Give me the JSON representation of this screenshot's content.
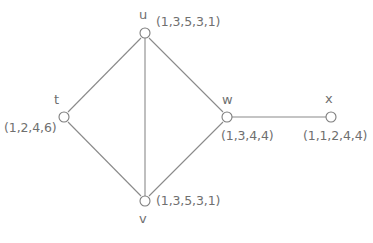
{
  "diagram": {
    "background_color": "#ffffff",
    "line_color": "#8a8a8a",
    "text_color": "#6f6f6f",
    "nodes": [
      {
        "id": "t",
        "label": "t",
        "tuple": "(1,2,4,6)",
        "cx": 64,
        "cy": 117,
        "r": 5
      },
      {
        "id": "u",
        "label": "u",
        "tuple": "(1,3,5,3,1)",
        "cx": 145,
        "cy": 33,
        "r": 5
      },
      {
        "id": "v",
        "label": "v",
        "tuple": "(1,3,5,3,1)",
        "cx": 145,
        "cy": 201,
        "r": 5
      },
      {
        "id": "w",
        "label": "w",
        "tuple": "(1,3,4,4)",
        "cx": 227,
        "cy": 117,
        "r": 5
      },
      {
        "id": "x",
        "label": "x",
        "tuple": "(1,1,2,4,4)",
        "cx": 331,
        "cy": 117,
        "r": 5
      }
    ],
    "edges": [
      {
        "id": "t-u",
        "from": "t",
        "to": "u"
      },
      {
        "id": "t-v",
        "from": "t",
        "to": "v"
      },
      {
        "id": "u-v",
        "from": "u",
        "to": "v"
      },
      {
        "id": "u-w",
        "from": "u",
        "to": "w"
      },
      {
        "id": "v-w",
        "from": "v",
        "to": "w"
      },
      {
        "id": "w-x",
        "from": "w",
        "to": "x"
      }
    ]
  }
}
